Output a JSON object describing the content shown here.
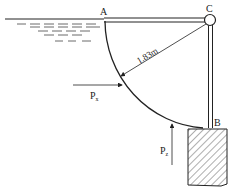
{
  "diagram": {
    "type": "curved-gate-hydrostatics",
    "labels": {
      "point_a": "A",
      "point_b": "B",
      "point_c": "C",
      "radius": "1.83m",
      "force_horizontal": "P",
      "force_horizontal_sub": "x",
      "force_vertical": "P",
      "force_vertical_sub": "z"
    },
    "colors": {
      "line": "#222222",
      "background": "#ffffff"
    }
  }
}
